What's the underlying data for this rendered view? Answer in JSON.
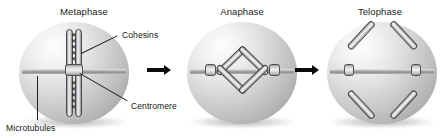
{
  "figure": {
    "background_color": "#ffffff",
    "width": 441,
    "height": 138
  },
  "colors": {
    "cell_highlight": "#fdfdfd",
    "cell_midtone": "#cfcfcf",
    "cell_shadow": "#969696",
    "chromatid_outline": "#4a4a4a",
    "spindle_gray": "#8e8e8e",
    "arrow_black": "#0b0b0b",
    "label_text": "#141414"
  },
  "panels": [
    {
      "id": "metaphase",
      "title": "Metaphase",
      "structure": "paired sister chromatids aligned vertically at the cell equator, joined along their length by cohesins",
      "chromatid_orientation": "vertical",
      "cohesin_count": 10
    },
    {
      "id": "anaphase",
      "title": "Anaphase",
      "structure": "four chromatid arms splayed into a diamond, centromeres pulled toward opposite poles",
      "chromatid_orientation": "diamond",
      "cohesin_count": 0
    },
    {
      "id": "telophase",
      "title": "Telophase",
      "structure": "two separated V-shaped daughter chromosomes drawn to opposite poles",
      "chromatid_orientation": "v-shaped pair",
      "cohesin_count": 0
    }
  ],
  "callouts": [
    {
      "id": "cohesins",
      "label": "Cohesins",
      "points_to": "links between sister chromatids"
    },
    {
      "id": "centromere",
      "label": "Centromere",
      "points_to": "chromatid junction at spindle attachment"
    },
    {
      "id": "microtubules",
      "label": "Microtubules",
      "points_to": "spindle fiber crossing the cell"
    }
  ],
  "arrows": [
    {
      "id": "arrow-metaphase-to-anaphase",
      "symbol": "right-arrow"
    },
    {
      "id": "arrow-anaphase-to-telophase",
      "symbol": "right-arrow"
    }
  ],
  "cohesin_glyph": "✕"
}
